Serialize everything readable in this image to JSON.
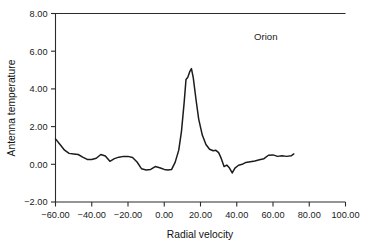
{
  "chart_data": {
    "type": "line",
    "title": "",
    "xlabel": "Radial velocity",
    "ylabel": "Antenna temperature",
    "xlim": [
      -60,
      100
    ],
    "ylim": [
      -2.0,
      8.0
    ],
    "grid": false,
    "legend": "none",
    "annotations": [
      {
        "text": "Orion",
        "x": 56,
        "y": 6.6
      }
    ],
    "xticks": [
      -60,
      -40,
      -20,
      0,
      20,
      40,
      60,
      80,
      100
    ],
    "xticklabels": [
      "-60.00",
      "-40.00",
      "-20.00",
      "0.00",
      "20.00",
      "40.00",
      "60.00",
      "80.00",
      "100.00"
    ],
    "yticks": [
      -2.0,
      0.0,
      2.0,
      4.0,
      6.0,
      8.0
    ],
    "yticklabels": [
      "-2.00",
      "0.00",
      "2.00",
      "4.00",
      "6.00",
      "8.00"
    ],
    "series": [
      {
        "name": "Orion spectrum",
        "color": "#1c1c1c",
        "x": [
          -60.0,
          -57.5,
          -55.0,
          -52.5,
          -50.0,
          -47.5,
          -45.0,
          -42.5,
          -40.0,
          -37.5,
          -35.0,
          -32.5,
          -30.0,
          -27.5,
          -25.0,
          -22.5,
          -20.0,
          -17.5,
          -15.0,
          -12.5,
          -10.0,
          -7.5,
          -5.0,
          -2.5,
          0.0,
          2.0,
          4.0,
          6.0,
          8.0,
          9.5,
          11.0,
          12.0,
          13.0,
          14.0,
          15.0,
          16.0,
          17.5,
          19.0,
          21.0,
          23.0,
          25.0,
          27.0,
          28.5,
          30.0,
          31.5,
          33.0,
          34.5,
          36.0,
          37.5,
          39.0,
          41.0,
          43.0,
          45.0,
          47.5,
          50.0,
          52.5,
          55.0,
          57.5,
          60.0,
          62.5,
          65.0,
          67.5,
          70.0,
          71.5
        ],
        "y": [
          1.35,
          1.05,
          0.75,
          0.58,
          0.55,
          0.52,
          0.38,
          0.26,
          0.25,
          0.32,
          0.52,
          0.44,
          0.16,
          0.3,
          0.38,
          0.42,
          0.42,
          0.36,
          0.12,
          -0.24,
          -0.3,
          -0.27,
          -0.12,
          -0.18,
          -0.27,
          -0.3,
          -0.28,
          0.1,
          0.75,
          1.75,
          3.3,
          4.5,
          4.62,
          4.9,
          5.08,
          4.6,
          3.45,
          2.4,
          1.55,
          1.05,
          0.8,
          0.72,
          0.74,
          0.62,
          0.3,
          -0.12,
          -0.04,
          -0.2,
          -0.46,
          -0.2,
          -0.05,
          0.0,
          0.1,
          0.14,
          0.18,
          0.24,
          0.3,
          0.48,
          0.5,
          0.42,
          0.45,
          0.42,
          0.45,
          0.55
        ]
      }
    ]
  },
  "figure": {
    "background_color": "#ffffff",
    "line_color": "#1c1c1c",
    "axis_color": "#2b2b2b"
  }
}
